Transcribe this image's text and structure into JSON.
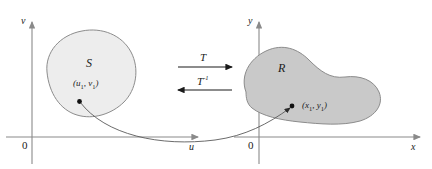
{
  "figure": {
    "type": "math-transformation-diagram",
    "colors": {
      "background": "#ffffff",
      "axis": "#8a8a8a",
      "curve": "#666666",
      "blob_outline": "#8c8c8c",
      "blob_s_fill": "#ededed",
      "blob_r_fill": "#c9c9c9",
      "text": "#1a1a1a",
      "arrow": "#1a1a1a"
    }
  },
  "uv_plane": {
    "vertical_axis_label": "v",
    "horizontal_axis_label": "u",
    "origin_label": "0",
    "region_label": "S",
    "point_label_main": "(u",
    "point_label_sub1": "1",
    "point_label_mid": ", v",
    "point_label_sub2": "1",
    "point_label_end": ")"
  },
  "xy_plane": {
    "vertical_axis_label": "y",
    "horizontal_axis_label": "x",
    "origin_label": "0",
    "region_label": "R",
    "point_label_main": "(x",
    "point_label_sub1": "1",
    "point_label_mid": ", y",
    "point_label_sub2": "1",
    "point_label_end": ")"
  },
  "mappings": {
    "forward_label": "T",
    "inverse_label_base": "T",
    "inverse_label_exponent": "-1"
  }
}
